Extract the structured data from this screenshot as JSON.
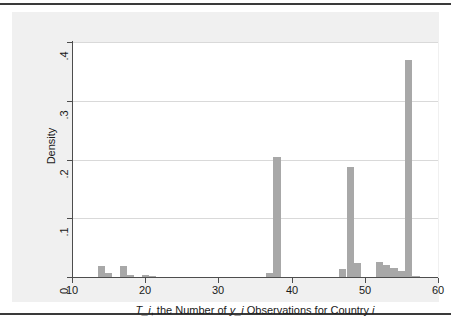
{
  "figure": {
    "background": "#f0f0f0",
    "plot_background": "#ffffff",
    "bar_color": "#a8a8a8",
    "axis_color": "#4d4d4d",
    "grid_color": "#d9d9d9"
  },
  "chart_data": {
    "type": "bar",
    "chart_style": "histogram",
    "title": "",
    "subtitle": "",
    "xlabel": "T_i, the Number of y_i Observations for Country i",
    "ylabel": "Density",
    "xlim": [
      10,
      60
    ],
    "ylim": [
      0,
      0.4
    ],
    "xticks": [
      10,
      20,
      30,
      40,
      50,
      60
    ],
    "xtick_labels": [
      "10",
      "20",
      "30",
      "40",
      "50",
      "60"
    ],
    "yticks": [
      0,
      0.1,
      0.2,
      0.3,
      0.4
    ],
    "ytick_labels": [
      "0",
      ".1",
      ".2",
      ".3",
      ".4"
    ],
    "grid": "horizontal",
    "legend": "none",
    "bin_width": 1,
    "x": [
      14,
      15,
      17,
      18,
      20,
      21,
      37,
      38,
      47,
      48,
      49,
      52,
      53,
      54,
      55,
      56,
      57
    ],
    "values": [
      0.018,
      0.006,
      0.018,
      0.004,
      0.003,
      0.0015,
      0.006,
      0.204,
      0.013,
      0.187,
      0.023,
      0.025,
      0.02,
      0.015,
      0.01,
      0.37,
      0.002
    ],
    "bars": [
      {
        "x": 14,
        "density": 0.018
      },
      {
        "x": 15,
        "density": 0.006
      },
      {
        "x": 17,
        "density": 0.018
      },
      {
        "x": 18,
        "density": 0.004
      },
      {
        "x": 20,
        "density": 0.003
      },
      {
        "x": 21,
        "density": 0.0015
      },
      {
        "x": 37,
        "density": 0.006
      },
      {
        "x": 38,
        "density": 0.204
      },
      {
        "x": 47,
        "density": 0.013
      },
      {
        "x": 48,
        "density": 0.187
      },
      {
        "x": 49,
        "density": 0.023
      },
      {
        "x": 52,
        "density": 0.025
      },
      {
        "x": 53,
        "density": 0.02
      },
      {
        "x": 54,
        "density": 0.015
      },
      {
        "x": 55,
        "density": 0.01
      },
      {
        "x": 56,
        "density": 0.37
      },
      {
        "x": 57,
        "density": 0.002
      }
    ]
  }
}
